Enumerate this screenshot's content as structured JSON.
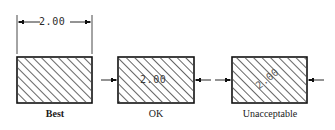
{
  "figure": {
    "background_color": "#ffffff",
    "line_color": "#1a1a1a",
    "hatch_color": "#555555",
    "dim_text_color": "#2b2b2b"
  },
  "items": [
    {
      "id": "best",
      "label": "Best",
      "dimension_value": "2.00",
      "dimension_placement": "above-outside",
      "rotation_deg": 0
    },
    {
      "id": "ok",
      "label": "OK",
      "dimension_value": "2.00",
      "dimension_placement": "inside-horizontal",
      "rotation_deg": 0
    },
    {
      "id": "unacceptable",
      "label": "Unacceptable",
      "dimension_value": "2.00",
      "dimension_placement": "inside-rotated",
      "rotation_deg": -38
    }
  ]
}
